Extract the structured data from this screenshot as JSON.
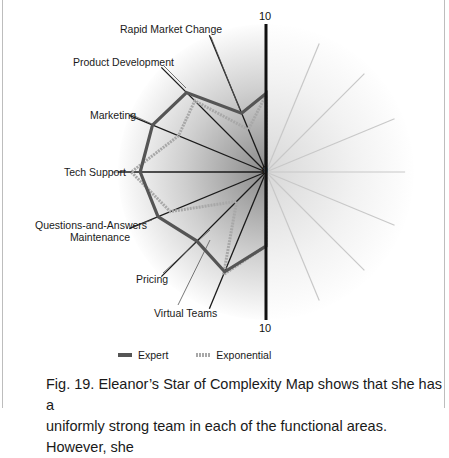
{
  "figure": {
    "caption_line1": "Fig. 19. Eleanor’s Star of Complexity Map shows that she has a",
    "caption_line2": "uniformly strong team in each of the functional areas. However, she"
  },
  "axis": {
    "top_label": "10",
    "center_label": "0",
    "bottom_label": "10"
  },
  "legend": {
    "expert": "Expert",
    "exponential": "Exponential"
  },
  "labels": {
    "rapid_market_change": "Rapid Market Change",
    "product_development": "Product Development",
    "marketing": "Marketing",
    "tech_support": "Tech Support",
    "qa_line1": "Questions-and-Answers",
    "qa_line2": "Maintenance",
    "pricing": "Pricing",
    "virtual_teams": "Virtual Teams"
  },
  "colors": {
    "expert": "#555555",
    "exponential": "#a8a8a8",
    "axis": "#111111",
    "spoke_left": "#1a1a1a",
    "spoke_right": "#c8c8c8"
  },
  "chart_data": {
    "type": "radar",
    "title": "Star of Complexity Map",
    "range": [
      0,
      10
    ],
    "grid": false,
    "legend_position": "bottom",
    "categories": [
      "Top axis",
      "Rapid Market Change",
      "Product Development",
      "Marketing",
      "Tech Support",
      "Questions-and-Answers Maintenance",
      "Pricing",
      "Virtual Teams",
      "Bottom axis"
    ],
    "series": [
      {
        "name": "Expert",
        "values": [
          5.3,
          4.3,
          7.6,
          8.3,
          8.5,
          7.9,
          6.6,
          7.3,
          5.0
        ]
      },
      {
        "name": "Exponential",
        "values": [
          5.2,
          3.1,
          6.8,
          6.4,
          9.1,
          7.0,
          2.8,
          7.5,
          5.0
        ]
      }
    ],
    "annotations": [
      "10 (top)",
      "0 (center)",
      "10 (bottom)"
    ]
  }
}
